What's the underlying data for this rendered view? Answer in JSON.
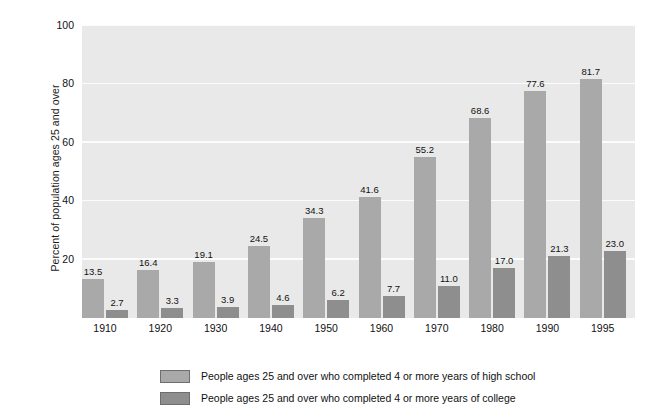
{
  "chart_data": {
    "type": "bar",
    "title": "",
    "xlabel": "",
    "ylabel": "Percent of population ages 25 and over",
    "ylim": [
      0,
      100
    ],
    "yticks": [
      20,
      40,
      60,
      80,
      100
    ],
    "grid": true,
    "legend_position": "bottom",
    "categories": [
      "1910",
      "1920",
      "1930",
      "1940",
      "1950",
      "1960",
      "1970",
      "1980",
      "1990",
      "1995"
    ],
    "series": [
      {
        "name": "People ages 25 and over who completed 4 or more years of high school",
        "color": "#a9a9a9",
        "values": [
          13.5,
          16.4,
          19.1,
          24.5,
          34.3,
          41.6,
          55.2,
          68.6,
          77.6,
          81.7
        ],
        "labels": [
          "13.5",
          "16.4",
          "19.1",
          "24.5",
          "34.3",
          "41.6",
          "55.2",
          "68.6",
          "77.6",
          "81.7"
        ]
      },
      {
        "name": "People ages 25 and over who completed 4 or more years of college",
        "color": "#8e8e8e",
        "values": [
          2.7,
          3.3,
          3.9,
          4.6,
          6.2,
          7.7,
          11.0,
          17.0,
          21.3,
          23.0
        ],
        "labels": [
          "2.7",
          "3.3",
          "3.9",
          "4.6",
          "6.2",
          "7.7",
          "11.0",
          "17.0",
          "21.3",
          "23.0"
        ]
      }
    ]
  },
  "axes": {
    "y_title": "Percent of population ages 25 and over",
    "y_tick_labels": [
      "100",
      "80",
      "60",
      "40",
      "20"
    ],
    "x_tick_labels": [
      "1910",
      "1920",
      "1930",
      "1940",
      "1950",
      "1960",
      "1970",
      "1980",
      "1990",
      "1995"
    ]
  },
  "legend": {
    "entries": [
      {
        "swatch": "high-school-swatch",
        "label": "People ages 25 and over who completed 4 or more years of high school"
      },
      {
        "swatch": "college-swatch",
        "label": "People ages 25 and over who completed 4 or more years of college"
      }
    ]
  },
  "colors": {
    "plot_background": "#e9e9e9",
    "gridline": "#fcfcfc",
    "high_school_bar": "#a9a9a9",
    "college_bar": "#8e8e8e",
    "page_background": "#ffffff",
    "text": "#111111"
  }
}
